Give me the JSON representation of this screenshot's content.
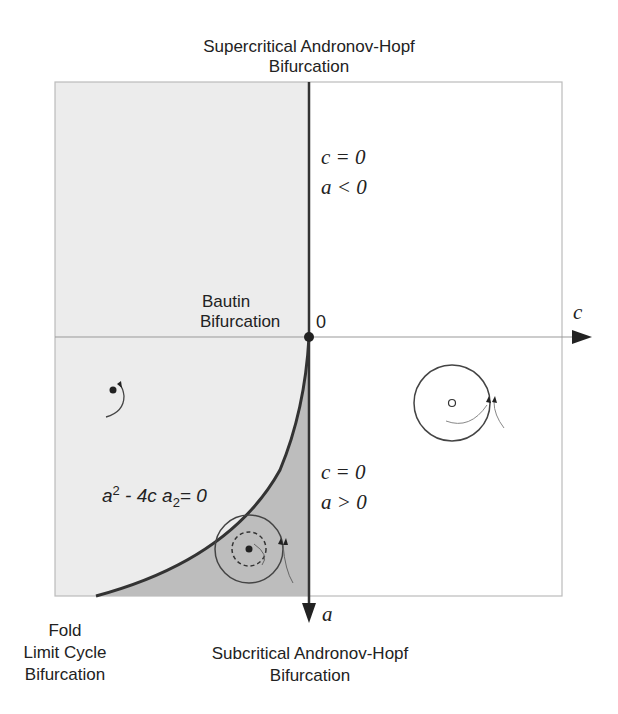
{
  "title": {
    "line1": "Supercritical Andronov-Hopf",
    "line2": "Bifurcation"
  },
  "labels": {
    "bautin_line1": "Bautin",
    "bautin_line2": "Bifurcation",
    "origin": "0",
    "fold_line1": "Fold",
    "fold_line2": "Limit Cycle",
    "fold_line3": "Bifurcation",
    "subcritical_line1": "Subcritical Andronov-Hopf",
    "subcritical_line2": "Bifurcation"
  },
  "axes": {
    "horizontal_label": "c",
    "vertical_label": "a"
  },
  "conditions": {
    "upper": {
      "line1": "c  = 0",
      "line2": "a < 0"
    },
    "lower": {
      "line1": "c  = 0",
      "line2": "a > 0"
    }
  },
  "curve_equation": {
    "a": "a",
    "exp": "2",
    "middle": " - 4c a",
    "sub": "2",
    "rhs": "= 0"
  },
  "regions": [
    {
      "name": "left-stable-focus",
      "fill": "#ececec"
    },
    {
      "name": "bistable-region",
      "fill": "#bdbdbd"
    },
    {
      "name": "right-limit-cycle",
      "fill": "#ffffff"
    }
  ],
  "colors": {
    "axis": "#333333",
    "frame": "#bbbbbb",
    "curve": "#333333",
    "text": "#222222"
  }
}
